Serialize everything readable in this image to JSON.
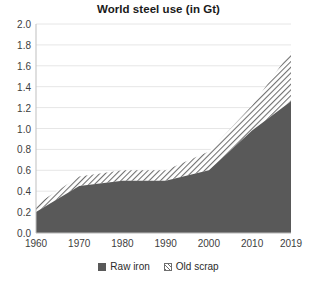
{
  "chart_data": {
    "type": "area",
    "title": "World steel use (in Gt)",
    "xlabel": "",
    "ylabel": "",
    "stacked": true,
    "grid": true,
    "legend_position": "bottom",
    "categories": [
      "1960",
      "1970",
      "1980",
      "1990",
      "2000",
      "2010",
      "2019"
    ],
    "x": [
      1960,
      1970,
      1980,
      1990,
      2000,
      2010,
      2019
    ],
    "xlim": [
      1960,
      2019
    ],
    "ylim": [
      0.0,
      2.0
    ],
    "ytick_labels": [
      "0.0",
      "0.2",
      "0.4",
      "0.6",
      "0.8",
      "1.0",
      "1.2",
      "1.4",
      "1.6",
      "1.8",
      "2.0"
    ],
    "yticks": [
      0.0,
      0.2,
      0.4,
      0.6,
      0.8,
      1.0,
      1.2,
      1.4,
      1.6,
      1.8,
      2.0
    ],
    "xtick_labels": [
      "1960",
      "1970",
      "1980",
      "1990",
      "2000",
      "2010",
      "2019"
    ],
    "series": [
      {
        "name": "Raw iron",
        "fill": "solid",
        "color": "#595959",
        "values": [
          0.2,
          0.45,
          0.5,
          0.5,
          0.6,
          0.98,
          1.26
        ]
      },
      {
        "name": "Old scrap",
        "fill": "hatch",
        "color": "#ffffff",
        "hatch_color": "#6e6e6e",
        "values": [
          0.07,
          0.09,
          0.1,
          0.1,
          0.18,
          0.24,
          0.48
        ]
      }
    ],
    "stack_totals": [
      0.27,
      0.54,
      0.6,
      0.6,
      0.78,
      1.22,
      1.74
    ]
  },
  "legend": {
    "entries": [
      {
        "label": "Raw iron",
        "swatch": "solid-dark-gray-swatch"
      },
      {
        "label": "Old scrap",
        "swatch": "hatched-swatch"
      }
    ]
  },
  "colors": {
    "raw_iron": "#595959",
    "old_scrap_hatch": "#6e6e6e",
    "gridline": "#e6e6e6",
    "axis": "#bfbfbf",
    "text": "#2b2b2b",
    "background": "#ffffff"
  }
}
